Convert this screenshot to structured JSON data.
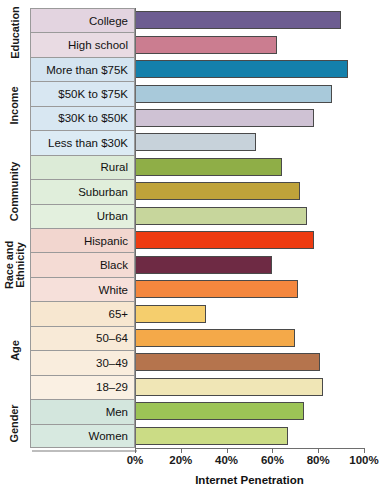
{
  "chart_data": {
    "type": "bar",
    "orientation": "horizontal",
    "title": "",
    "xlabel": "Internet Penetration",
    "ylabel": "",
    "xlim": [
      0,
      100
    ],
    "xticks": [
      "0%",
      "20%",
      "40%",
      "60%",
      "80%",
      "100%"
    ],
    "xtick_values": [
      0,
      20,
      40,
      60,
      80,
      100
    ],
    "grid": false,
    "legend": "none",
    "groups": [
      {
        "name": "Education",
        "panel_color": "#e3d4e0",
        "categories": [
          "College",
          "High school"
        ],
        "values": [
          90,
          62
        ],
        "bar_colors": [
          "#6d5d91",
          "#cb7d90"
        ]
      },
      {
        "name": "Income",
        "panel_color": "#d4e4f0",
        "categories": [
          "More than $75K",
          "$50K to $75K",
          "$30K to $50K",
          "Less than $30K"
        ],
        "values": [
          93,
          86,
          78,
          53
        ],
        "bar_colors": [
          "#1480ab",
          "#a8c9da",
          "#cfc2d4",
          "#c7d2da"
        ]
      },
      {
        "name": "Community",
        "panel_color": "#dcebd7",
        "categories": [
          "Rural",
          "Suburban",
          "Urban"
        ],
        "values": [
          64,
          72,
          75
        ],
        "bar_colors": [
          "#8fae47",
          "#bfa33a",
          "#c7d69c"
        ]
      },
      {
        "name": "Race and Ethnicity",
        "panel_color": "#f2d6cf",
        "categories": [
          "Hispanic",
          "Black",
          "White"
        ],
        "values": [
          78,
          60,
          71
        ],
        "bar_colors": [
          "#ee3b11",
          "#6e2a44",
          "#f4873e"
        ]
      },
      {
        "name": "Age",
        "panel_color": "#f7e7d0",
        "categories": [
          "65+",
          "50–64",
          "30–49",
          "18–29"
        ],
        "values": [
          31,
          70,
          81,
          82
        ],
        "bar_colors": [
          "#f5ce6d",
          "#f4a949",
          "#b5744d",
          "#f0e6b6"
        ]
      },
      {
        "name": "Gender",
        "panel_color": "#d3e6dd",
        "categories": [
          "Men",
          "Women"
        ],
        "values": [
          74,
          67
        ],
        "bar_colors": [
          "#9cc456",
          "#cbdc85"
        ]
      }
    ],
    "rows": [
      {
        "group": "Education",
        "category": "College",
        "value": 90,
        "bar_color": "#6d5d91",
        "panel_color": "#e3d4e0"
      },
      {
        "group": "Education",
        "category": "High school",
        "value": 62,
        "bar_color": "#cb7d90",
        "panel_color": "#e9dbe3"
      },
      {
        "group": "Income",
        "category": "More than $75K",
        "value": 93,
        "bar_color": "#1480ab",
        "panel_color": "#d4e4f0"
      },
      {
        "group": "Income",
        "category": "$50K to $75K",
        "value": 86,
        "bar_color": "#a8c9da",
        "panel_color": "#d8e7f2"
      },
      {
        "group": "Income",
        "category": "$30K to $50K",
        "value": 78,
        "bar_color": "#cfc2d4",
        "panel_color": "#d8e7f2"
      },
      {
        "group": "Income",
        "category": "Less than $30K",
        "value": 53,
        "bar_color": "#c7d2da",
        "panel_color": "#dcebf4"
      },
      {
        "group": "Community",
        "category": "Rural",
        "value": 64,
        "bar_color": "#8fae47",
        "panel_color": "#dcebd7"
      },
      {
        "group": "Community",
        "category": "Suburban",
        "value": 72,
        "bar_color": "#bfa33a",
        "panel_color": "#e0eedb"
      },
      {
        "group": "Community",
        "category": "Urban",
        "value": 75,
        "bar_color": "#c7d69c",
        "panel_color": "#e3f0de"
      },
      {
        "group": "Race and Ethnicity",
        "category": "Hispanic",
        "value": 78,
        "bar_color": "#ee3b11",
        "panel_color": "#f2d6cf"
      },
      {
        "group": "Race and Ethnicity",
        "category": "Black",
        "value": 60,
        "bar_color": "#6e2a44",
        "panel_color": "#f4dbd4"
      },
      {
        "group": "Race and Ethnicity",
        "category": "White",
        "value": 71,
        "bar_color": "#f4873e",
        "panel_color": "#f6e0da"
      },
      {
        "group": "Age",
        "category": "65+",
        "value": 31,
        "bar_color": "#f5ce6d",
        "panel_color": "#f7e7d0"
      },
      {
        "group": "Age",
        "category": "50–64",
        "value": 70,
        "bar_color": "#f4a949",
        "panel_color": "#f8ead7"
      },
      {
        "group": "Age",
        "category": "30–49",
        "value": 81,
        "bar_color": "#b5744d",
        "panel_color": "#f9eddd"
      },
      {
        "group": "Age",
        "category": "18–29",
        "value": 82,
        "bar_color": "#f0e6b6",
        "panel_color": "#faf0e3"
      },
      {
        "group": "Gender",
        "category": "Men",
        "value": 74,
        "bar_color": "#9cc456",
        "panel_color": "#d3e6dd"
      },
      {
        "group": "Gender",
        "category": "Women",
        "value": 67,
        "bar_color": "#cbdc85",
        "panel_color": "#d7e9e0"
      }
    ]
  }
}
